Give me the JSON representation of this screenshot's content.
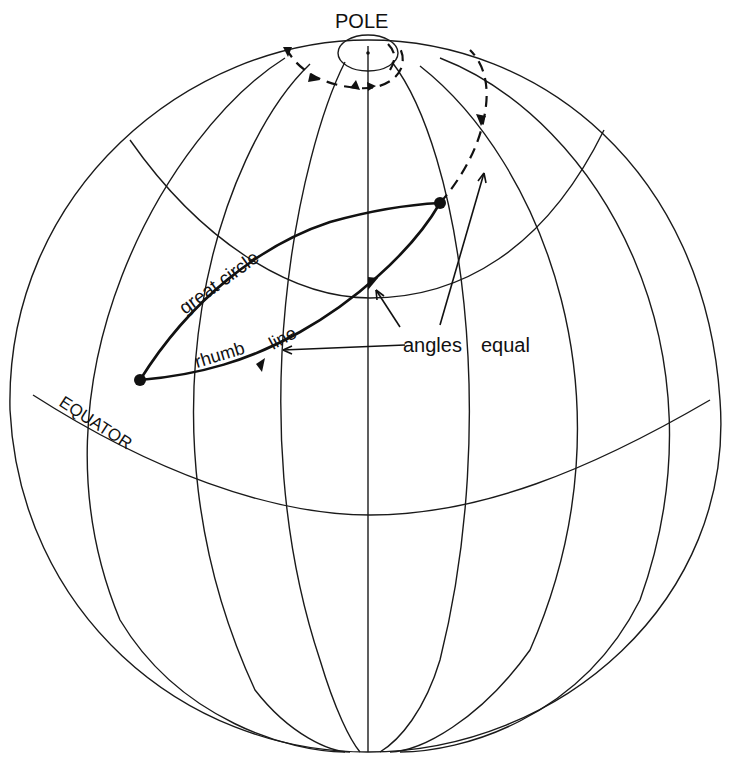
{
  "diagram": {
    "labels": {
      "pole": "POLE",
      "equator": "EQUATOR",
      "great_circle": "great circle",
      "rhumb_line": "rhumb line",
      "rhumb_word1": "rhumb",
      "rhumb_word2": "line",
      "great_word1": "great",
      "great_word2": "circle",
      "angles": "angles",
      "equal": "equal"
    },
    "elements": {
      "globe_outline": "globe",
      "meridians_count": 7,
      "parallels": [
        "equator",
        "mid-latitude parallel"
      ],
      "endpoints": [
        "start-point",
        "end-point"
      ]
    },
    "colors": {
      "ink": "#111111",
      "background": "#ffffff"
    }
  }
}
